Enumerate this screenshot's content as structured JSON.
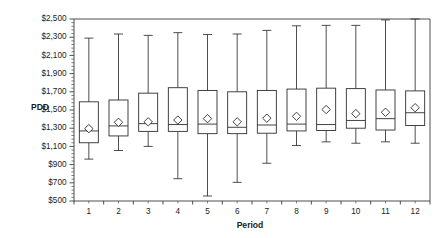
{
  "chart_data": {
    "type": "box",
    "title": "",
    "xlabel": "Period",
    "ylabel": "PDD",
    "categories": [
      "1",
      "2",
      "3",
      "4",
      "5",
      "6",
      "7",
      "8",
      "9",
      "10",
      "11",
      "12"
    ],
    "ylim": [
      500,
      2500
    ],
    "ytick_step": 200,
    "ytick_labels": [
      "$500",
      "$700",
      "$900",
      "$1,100",
      "$1,300",
      "$1,500",
      "$1,700",
      "$1,900",
      "$2,100",
      "$2,300",
      "$2,500"
    ],
    "ytick_values": [
      500,
      700,
      900,
      1100,
      1300,
      1500,
      1700,
      1900,
      2100,
      2300,
      2500
    ],
    "minor_ticks_per_interval": 4,
    "grid": false,
    "legend": "none",
    "mean_marker": "diamond",
    "boxes": [
      {
        "period": "1",
        "whisker_low": 960,
        "q1": 1140,
        "median": 1270,
        "mean": 1295,
        "q3": 1590,
        "whisker_high": 2290
      },
      {
        "period": "2",
        "whisker_low": 1055,
        "q1": 1215,
        "median": 1325,
        "mean": 1365,
        "q3": 1610,
        "whisker_high": 2335
      },
      {
        "period": "3",
        "whisker_low": 1100,
        "q1": 1265,
        "median": 1350,
        "mean": 1370,
        "q3": 1685,
        "whisker_high": 2320
      },
      {
        "period": "4",
        "whisker_low": 745,
        "q1": 1265,
        "median": 1340,
        "mean": 1390,
        "q3": 1745,
        "whisker_high": 2350
      },
      {
        "period": "5",
        "whisker_low": 555,
        "q1": 1240,
        "median": 1345,
        "mean": 1405,
        "q3": 1715,
        "whisker_high": 2330
      },
      {
        "period": "6",
        "whisker_low": 705,
        "q1": 1240,
        "median": 1310,
        "mean": 1370,
        "q3": 1700,
        "whisker_high": 2335
      },
      {
        "period": "7",
        "whisker_low": 915,
        "q1": 1245,
        "median": 1335,
        "mean": 1410,
        "q3": 1715,
        "whisker_high": 2375
      },
      {
        "period": "8",
        "whisker_low": 1110,
        "q1": 1270,
        "median": 1345,
        "mean": 1430,
        "q3": 1730,
        "whisker_high": 2425
      },
      {
        "period": "9",
        "whisker_low": 1150,
        "q1": 1275,
        "median": 1340,
        "mean": 1505,
        "q3": 1740,
        "whisker_high": 2430
      },
      {
        "period": "10",
        "whisker_low": 1135,
        "q1": 1300,
        "median": 1385,
        "mean": 1460,
        "q3": 1735,
        "whisker_high": 2430
      },
      {
        "period": "11",
        "whisker_low": 1150,
        "q1": 1280,
        "median": 1405,
        "mean": 1475,
        "q3": 1720,
        "whisker_high": 2490
      },
      {
        "period": "12",
        "whisker_low": 1135,
        "q1": 1330,
        "median": 1470,
        "mean": 1525,
        "q3": 1710,
        "whisker_high": 2500
      }
    ]
  },
  "colors": {
    "axis": "#3a3a3a",
    "box_stroke": "#2e2e2e",
    "box_fill": "#ffffff",
    "background": "#ffffff",
    "text": "#1a1a1a"
  }
}
